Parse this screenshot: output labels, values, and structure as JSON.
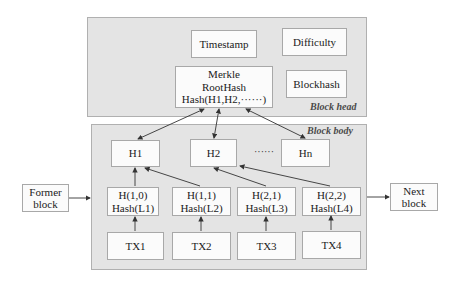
{
  "block_head": {
    "label": "Block head",
    "timestamp": "Timestamp",
    "difficulty": "Difficulty",
    "blockhash": "Blockhash",
    "merkle": {
      "line1": "Merkle",
      "line2": "RootHash",
      "line3": "Hash(H1,H2,······)"
    }
  },
  "block_body": {
    "label": "Block body",
    "hashes": [
      "H1",
      "H2",
      "Hn"
    ],
    "ellipsis": "······",
    "leaves": [
      {
        "h": "H(1,0)",
        "hash": "Hash(L1)"
      },
      {
        "h": "H(1,1)",
        "hash": "Hash(L2)"
      },
      {
        "h": "H(2,1)",
        "hash": "Hash(L3)"
      },
      {
        "h": "H(2,2)",
        "hash": "Hash(L4)"
      }
    ],
    "transactions": [
      "TX1",
      "TX2",
      "TX3",
      "TX4"
    ]
  },
  "former_block": {
    "line1": "Former",
    "line2": "block"
  },
  "next_block": {
    "line1": "Next",
    "line2": "block"
  }
}
